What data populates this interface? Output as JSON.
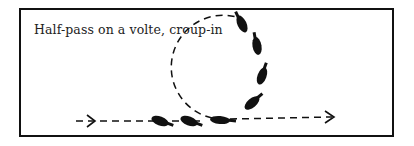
{
  "diagram": {
    "caption": "Half-pass on a volte, croup-in",
    "colors": {
      "ink": "#111111",
      "background": "#ffffff"
    },
    "path": {
      "entry_line": {
        "from": [
          78,
          121
        ],
        "to": [
          195,
          121
        ],
        "style": "dashed"
      },
      "volte": {
        "cx": 218,
        "cy": 66,
        "r": 52,
        "style": "dashed"
      },
      "exit_line": {
        "from": [
          215,
          120
        ],
        "to": [
          335,
          118
        ],
        "style": "dashed",
        "arrow": "end"
      }
    },
    "horse_figures": [
      {
        "x": 160,
        "y": 121,
        "rot": 20
      },
      {
        "x": 189,
        "y": 121,
        "rot": 20
      },
      {
        "x": 218,
        "y": 120,
        "rot": 5
      },
      {
        "x": 252,
        "y": 103,
        "rot": -40
      },
      {
        "x": 262,
        "y": 75,
        "rot": -70
      },
      {
        "x": 258,
        "y": 45,
        "rot": -100
      },
      {
        "x": 242,
        "y": 22,
        "rot": -115
      }
    ]
  }
}
